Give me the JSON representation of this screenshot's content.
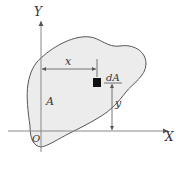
{
  "diagram": {
    "labels": {
      "y_axis": "Y",
      "x_axis": "X",
      "origin": "O",
      "area": "A",
      "element": "dA",
      "x_distance": "x",
      "y_distance": "y"
    },
    "colors": {
      "region_fill": "#ececec",
      "outline": "#555555",
      "axis": "#888888",
      "element_fill": "#111111",
      "text": "#333333"
    },
    "icons": {
      "element": "filled-square"
    }
  }
}
